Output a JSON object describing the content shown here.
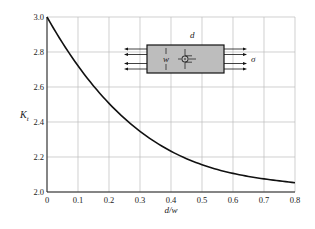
{
  "chart_data": {
    "type": "line",
    "title": "",
    "xlabel": "d/w",
    "ylabel": "K_t",
    "xlim": [
      0,
      0.8
    ],
    "ylim": [
      2.0,
      3.0
    ],
    "grid": true,
    "x_ticks": [
      "0",
      "0.1",
      "0.2",
      "0.3",
      "0.4",
      "0.5",
      "0.6",
      "0.7",
      "0.8"
    ],
    "y_ticks": [
      "2.0",
      "2.2",
      "2.4",
      "2.6",
      "2.8",
      "3.0"
    ],
    "series": [
      {
        "name": "Kt",
        "x": [
          0,
          0.05,
          0.1,
          0.15,
          0.2,
          0.25,
          0.3,
          0.35,
          0.4,
          0.45,
          0.5,
          0.55,
          0.6,
          0.65,
          0.7,
          0.75,
          0.8
        ],
        "values": [
          3.0,
          2.852,
          2.722,
          2.606,
          2.506,
          2.419,
          2.344,
          2.281,
          2.228,
          2.184,
          2.149,
          2.121,
          2.099,
          2.083,
          2.071,
          2.063,
          2.057
        ]
      }
    ],
    "annotations": {
      "inset_labels": {
        "d": "d",
        "w": "w",
        "sigma": "σ"
      }
    }
  }
}
